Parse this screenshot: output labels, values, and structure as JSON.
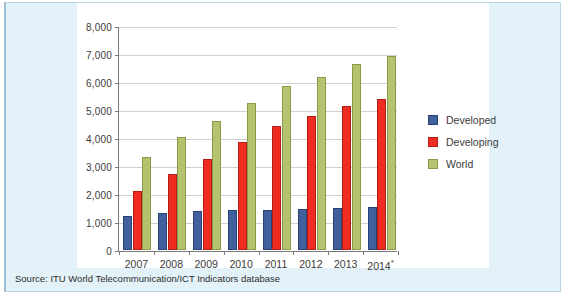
{
  "figure": {
    "source_note": "Source: ITU World Telecommunication/ICT Indicators database"
  },
  "colors": {
    "developed": "#41609e",
    "developing": "#ee2c22",
    "world": "#b4c36e",
    "panel_background": "#e3f2f8",
    "card_background": "#ffffff",
    "gridline": "#d0d0d0",
    "axis": "#7a7a7a"
  },
  "chart_data": {
    "type": "bar",
    "title": "",
    "subtitle": "",
    "xlabel": "",
    "ylabel": "",
    "categories": [
      "2007",
      "2008",
      "2009",
      "2010",
      "2011",
      "2012",
      "2013",
      "2014*"
    ],
    "series": [
      {
        "name": "Developed",
        "color": "#41609e",
        "values": [
          1230,
          1320,
          1410,
          1420,
          1450,
          1480,
          1520,
          1530
        ]
      },
      {
        "name": "Developing",
        "color": "#ee2c22",
        "values": [
          2120,
          2720,
          3270,
          3880,
          4450,
          4810,
          5180,
          5420
        ]
      },
      {
        "name": "World",
        "color": "#b4c36e",
        "values": [
          3350,
          4050,
          4640,
          5280,
          5880,
          6220,
          6670,
          6950
        ]
      }
    ],
    "ylim": [
      0,
      8000
    ],
    "yticks": [
      0,
      1000,
      2000,
      3000,
      4000,
      5000,
      6000,
      7000,
      8000
    ],
    "ytick_labels": [
      "0",
      "1,000",
      "2,000",
      "3,000",
      "4,000",
      "5,000",
      "6,000",
      "7,000",
      "8,000"
    ],
    "grid": true,
    "legend_position": "right",
    "legend": [
      "Developed",
      "Developing",
      "World"
    ]
  }
}
